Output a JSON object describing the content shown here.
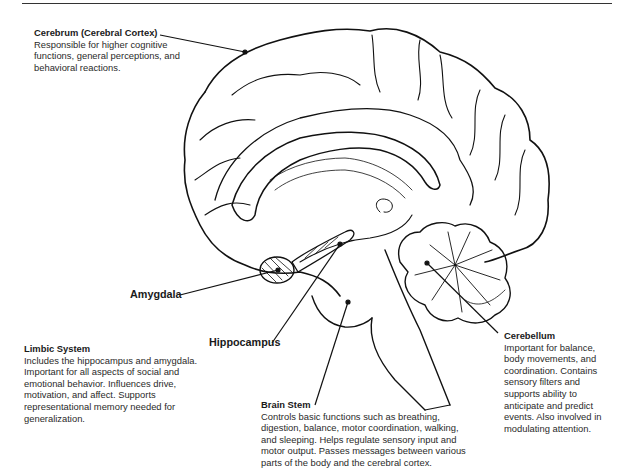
{
  "diagram": {
    "type": "annotated-brain-sagittal-section",
    "regions": [
      {
        "id": "cerebrum",
        "title": "Cerebrum (Cerebral Cortex)",
        "description": "Responsible for higher cognitive functions, general perceptions, and behavioral reactions."
      },
      {
        "id": "limbic",
        "title": "Limbic System",
        "description": "Includes the hippocampus and amygdala. Important for all aspects of social and emotional behavior. Influences drive, motivation, and affect. Supports representational memory needed for generalization."
      },
      {
        "id": "brainstem",
        "title": "Brain Stem",
        "description": "Controls basic functions such as breathing, digestion, balance, motor coordination, walking, and sleeping.  Helps regulate sensory input and motor output. Passes messages between various parts of the body and the cerebral cortex."
      },
      {
        "id": "cerebellum",
        "title": "Cerebellum",
        "description": "Important for balance, body movements, and coordination. Contains sensory filters and supports ability to anticipate and predict events. Also involved in modulating attention."
      }
    ],
    "tags": {
      "amygdala": "Amygdala",
      "hippocampus": "Hippocampus"
    },
    "colors": {
      "line": "#111111",
      "text": "#2a2a2a",
      "background": "#ffffff"
    }
  }
}
